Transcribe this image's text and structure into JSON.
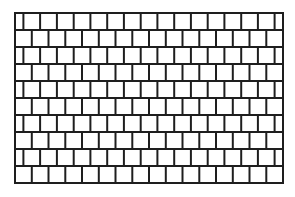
{
  "diagram": {
    "type": "brick-grid",
    "origin": {
      "x": 15,
      "y": 13
    },
    "width": 268,
    "rows": 10,
    "row_height": 17,
    "brick_width": 16.75,
    "odd_row_offset": 8.4,
    "stroke_color": "#1e1e1e",
    "fill_color": "#ffffff",
    "stroke_width": 2
  }
}
